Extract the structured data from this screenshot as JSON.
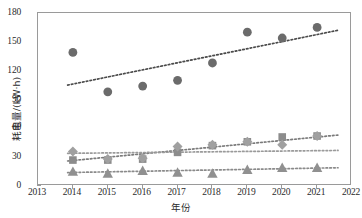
{
  "chart_data": {
    "type": "scatter",
    "title": "",
    "xlabel": "年份",
    "ylabel": "耗电量/(kW·h)",
    "xlim": [
      2013,
      2022
    ],
    "ylim": [
      0,
      180
    ],
    "xticks": [
      2013,
      2014,
      2015,
      2016,
      2017,
      2018,
      2019,
      2020,
      2021,
      2022
    ],
    "yticks": [
      0,
      30,
      60,
      90,
      120,
      150,
      180
    ],
    "grid": false,
    "legend": "none",
    "x": [
      2014,
      2015,
      2016,
      2017,
      2018,
      2019,
      2020,
      2021
    ],
    "series": [
      {
        "name": "circle-series",
        "marker": "circle",
        "color": "#6b6b6b",
        "values": [
          139,
          98,
          104,
          110,
          128,
          160,
          154,
          165
        ],
        "trendline": {
          "style": "dotted",
          "color": "#4a4a4a",
          "y_start": 105,
          "y_end": 162
        }
      },
      {
        "name": "square-series",
        "marker": "square",
        "color": "#8c8c8c",
        "values": [
          27,
          27,
          28,
          35,
          42,
          46,
          51,
          52
        ],
        "trendline": {
          "style": "dotted",
          "color": "#7a7a7a",
          "y_start": 26,
          "y_end": 53
        }
      },
      {
        "name": "diamond-series",
        "marker": "diamond",
        "color": "#a0a0a0",
        "values": [
          36,
          28,
          29,
          41,
          43,
          46,
          43,
          52
        ],
        "trendline": {
          "style": "dotted",
          "color": "#9a9a9a",
          "y_start": 34,
          "y_end": 37
        }
      },
      {
        "name": "triangle-series",
        "marker": "triangle",
        "color": "#909090",
        "values": [
          15,
          13,
          16,
          14,
          13,
          17,
          19,
          19
        ],
        "trendline": {
          "style": "dotted",
          "color": "#8a8a8a",
          "y_start": 14,
          "y_end": 19
        }
      }
    ]
  },
  "axes": {
    "frame_color": "#9a9a9a",
    "tick_color": "#9a9a9a",
    "label_color": "#2b2b2b"
  }
}
